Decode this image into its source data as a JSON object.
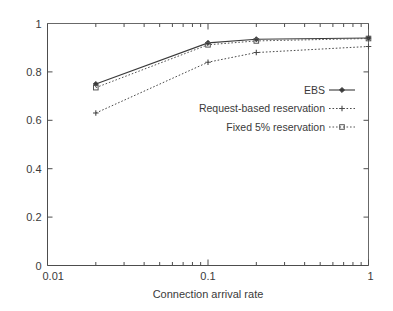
{
  "chart_data": {
    "type": "line",
    "title": "",
    "subtitle": "",
    "xlabel": "Connection arrival rate",
    "ylabel": "",
    "xscale": "log",
    "yscale": "linear",
    "xlim": [
      0.01,
      1
    ],
    "ylim": [
      0,
      1
    ],
    "grid": false,
    "legend_position": "center-right",
    "x": [
      0.02,
      0.1,
      0.2,
      1.0
    ],
    "xticks": [
      0.01,
      0.1,
      1
    ],
    "xtick_labels": [
      "0.01",
      "0.1",
      "1"
    ],
    "yticks": [
      0,
      0.2,
      0.4,
      0.6,
      0.8,
      1
    ],
    "ytick_labels": [
      "0",
      "0.2",
      "0.4",
      "0.6",
      "0.8",
      "1"
    ],
    "series": [
      {
        "name": "EBS",
        "values": [
          0.75,
          0.92,
          0.935,
          0.94
        ],
        "linestyle": "solid",
        "marker": "filled-diamond",
        "color": "#3a3a3a"
      },
      {
        "name": "Request-based reservation",
        "values": [
          0.63,
          0.84,
          0.88,
          0.905
        ],
        "linestyle": "dotted",
        "marker": "plus",
        "color": "#4a4a4a"
      },
      {
        "name": "Fixed 5% reservation",
        "values": [
          0.735,
          0.912,
          0.928,
          0.938
        ],
        "linestyle": "dotted",
        "marker": "open-square",
        "color": "#555555"
      }
    ]
  },
  "axis": {
    "x_title": "Connection arrival rate",
    "y_title": ""
  },
  "legend": {
    "entries": [
      {
        "label": "EBS"
      },
      {
        "label": "Request-based reservation"
      },
      {
        "label": "Fixed 5% reservation"
      }
    ]
  },
  "colors": {
    "axis": "#4d4d4d",
    "text": "#3a3a3a",
    "background": "#ffffff"
  }
}
